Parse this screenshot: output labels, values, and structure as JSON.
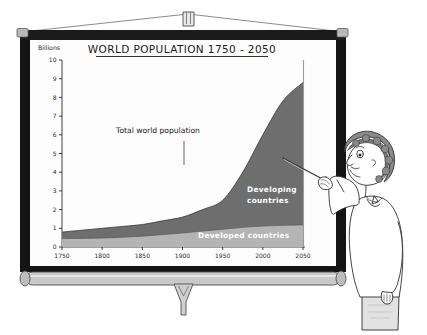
{
  "scene": {
    "kind": "cartoon-illustration",
    "description": "Woman with pointer standing beside a pull-down projector screen showing a population chart",
    "colors": {
      "frame_black": "#141414",
      "cap_gray": "#b9b9b9",
      "roller_gray": "#c9c9c9",
      "screen_white": "#fdfdfd",
      "developing_fill": "#6e6e6e",
      "developed_fill": "#b4b4b4",
      "ink": "#222222",
      "skin": "#ffffff",
      "hair": "#6b6b6b",
      "skirt": "#d8d8d8"
    }
  },
  "presenter": {
    "label": "presenter-figure",
    "pointer_label": "pointer-stick"
  },
  "screen": {
    "label": "projector-screen",
    "top_bar_label": "screen-top-bar",
    "roller_label": "screen-roller",
    "pull_handle_label": "screen-pull-handle",
    "hook_label": "screen-hanging-hook"
  },
  "chart_data": {
    "type": "area",
    "title": "WORLD POPULATION 1750 - 2050",
    "xlabel": "",
    "ylabel": "Billions",
    "ylim": [
      0,
      10
    ],
    "xlim": [
      1750,
      2050
    ],
    "grid": false,
    "legend": "inline-annotations",
    "yticks": [
      "10",
      "9",
      "8",
      "7",
      "6",
      "5",
      "4",
      "3",
      "2",
      "1",
      "0"
    ],
    "xticks": [
      "1750",
      "1800",
      "1850",
      "1900",
      "1950",
      "2000",
      "2050"
    ],
    "x": [
      1750,
      1775,
      1800,
      1825,
      1850,
      1875,
      1900,
      1925,
      1950,
      1975,
      2000,
      2025,
      2050
    ],
    "series": [
      {
        "name": "Developed countries",
        "values": [
          0.45,
          0.46,
          0.48,
          0.52,
          0.58,
          0.66,
          0.75,
          0.85,
          0.95,
          1.05,
          1.12,
          1.16,
          1.18
        ]
      },
      {
        "name": "Developing countries",
        "values": [
          0.35,
          0.44,
          0.52,
          0.58,
          0.62,
          0.74,
          0.85,
          1.15,
          1.55,
          2.95,
          4.88,
          6.65,
          7.62
        ]
      }
    ],
    "totals": [
      0.8,
      0.9,
      1.0,
      1.1,
      1.2,
      1.4,
      1.6,
      2.0,
      2.5,
      4.0,
      6.0,
      7.81,
      8.8
    ],
    "annotations": [
      {
        "name": "total-world-population",
        "text": "Total world population",
        "leader": true
      },
      {
        "name": "developing-countries",
        "line1": "Developing",
        "line2": "countries"
      },
      {
        "name": "developed-countries",
        "text": "Developed  countries"
      }
    ]
  }
}
